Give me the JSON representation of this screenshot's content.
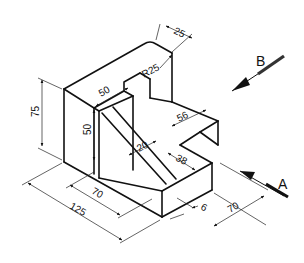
{
  "drawing": {
    "type": "isometric technical drawing",
    "view_labels": [
      {
        "id": "A",
        "text": "A"
      },
      {
        "id": "B",
        "text": "B"
      }
    ],
    "dimensions": {
      "overall_height": "75",
      "top_step_width": "50",
      "web_height": "50",
      "radius": "R25",
      "top_thickness": "25",
      "step_depth": "56",
      "rib_width": "20",
      "slot_depth": "38",
      "base_inner": "70",
      "base_overall": "125",
      "base_side": "70",
      "base_thickness": "6"
    }
  }
}
